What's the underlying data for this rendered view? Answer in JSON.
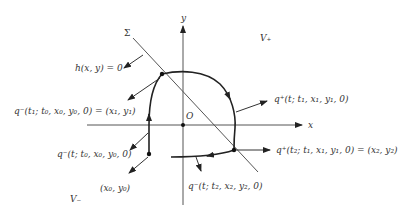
{
  "diagram": {
    "axes": {
      "x_label": "x",
      "y_label": "y",
      "origin_label": "O"
    },
    "regions": {
      "upper": "V₊",
      "lower": "V₋"
    },
    "switching_line": {
      "label": "Σ",
      "equation": "h(x, y) = 0"
    },
    "points": {
      "start": "(x₀, y₀)",
      "first_hit": "q⁻(t₁; t₀, x₀, y₀, 0) = (x₁, y₁)",
      "second_hit": "q⁺(t₂; t₁, x₁, y₁, 0) = (x₂, y₂)"
    },
    "trajectories": {
      "lower_from_start": "q⁻(t; t₀, x₀, y₀, 0)",
      "upper_from_first": "q⁺(t; t₁, x₁, y₁, 0)",
      "lower_from_second": "q⁻(t; t₂, x₂, y₂, 0)"
    }
  }
}
